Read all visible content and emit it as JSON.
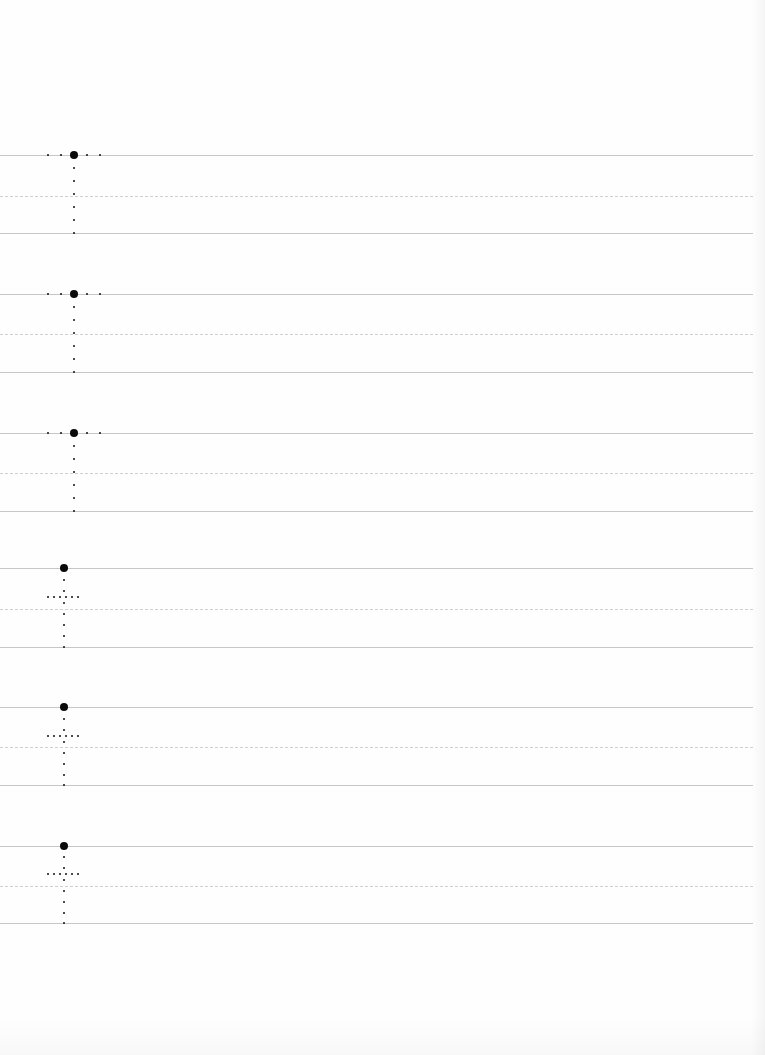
{
  "worksheet": {
    "title": "Handwriting Practice Worksheet",
    "page_width": 765,
    "page_height": 1055,
    "background_color": "#fefefe",
    "header_area_height": 155,
    "line_color": "#c6c6c6",
    "midline_color": "#cfcfd4",
    "dot_color": "#111111",
    "start_dot_color": "#0a0a0a",
    "line_left": 0,
    "line_right": 753,
    "row_pitch": 139
  },
  "rows": [
    {
      "index": 1,
      "label": "practice-row-1",
      "letter": "T",
      "top_y": 155,
      "mid_y": 196,
      "base_y": 233,
      "stem_x": 74,
      "start_dot": {
        "x": 74,
        "y": 155
      },
      "horizontal_dots": [
        {
          "x": 48,
          "y": 155
        },
        {
          "x": 61,
          "y": 155
        },
        {
          "x": 87,
          "y": 155
        },
        {
          "x": 100,
          "y": 155
        }
      ],
      "vertical_dots": [
        {
          "x": 74,
          "y": 168
        },
        {
          "x": 74,
          "y": 181
        },
        {
          "x": 74,
          "y": 194
        },
        {
          "x": 74,
          "y": 207
        },
        {
          "x": 74,
          "y": 220
        },
        {
          "x": 74,
          "y": 233
        }
      ]
    },
    {
      "index": 2,
      "label": "practice-row-2",
      "letter": "T",
      "top_y": 294,
      "mid_y": 334,
      "base_y": 372,
      "stem_x": 74,
      "start_dot": {
        "x": 74,
        "y": 294
      },
      "horizontal_dots": [
        {
          "x": 48,
          "y": 294
        },
        {
          "x": 61,
          "y": 294
        },
        {
          "x": 87,
          "y": 294
        },
        {
          "x": 100,
          "y": 294
        }
      ],
      "vertical_dots": [
        {
          "x": 74,
          "y": 307
        },
        {
          "x": 74,
          "y": 320
        },
        {
          "x": 74,
          "y": 333
        },
        {
          "x": 74,
          "y": 346
        },
        {
          "x": 74,
          "y": 359
        },
        {
          "x": 74,
          "y": 372
        }
      ]
    },
    {
      "index": 3,
      "label": "practice-row-3",
      "letter": "T",
      "top_y": 433,
      "mid_y": 473,
      "base_y": 511,
      "stem_x": 74,
      "start_dot": {
        "x": 74,
        "y": 433
      },
      "horizontal_dots": [
        {
          "x": 48,
          "y": 433
        },
        {
          "x": 61,
          "y": 433
        },
        {
          "x": 87,
          "y": 433
        },
        {
          "x": 100,
          "y": 433
        }
      ],
      "vertical_dots": [
        {
          "x": 74,
          "y": 446
        },
        {
          "x": 74,
          "y": 459
        },
        {
          "x": 74,
          "y": 472
        },
        {
          "x": 74,
          "y": 485
        },
        {
          "x": 74,
          "y": 498
        },
        {
          "x": 74,
          "y": 511
        }
      ]
    },
    {
      "index": 4,
      "label": "practice-row-4",
      "letter": "t",
      "top_y": 568,
      "mid_y": 609,
      "base_y": 647,
      "stem_x": 64,
      "start_dot": {
        "x": 64,
        "y": 568
      },
      "horizontal_dots": [
        {
          "x": 48,
          "y": 597
        },
        {
          "x": 54,
          "y": 597
        },
        {
          "x": 60,
          "y": 597
        },
        {
          "x": 66,
          "y": 597
        },
        {
          "x": 72,
          "y": 597
        },
        {
          "x": 78,
          "y": 597
        }
      ],
      "vertical_dots": [
        {
          "x": 64,
          "y": 580
        },
        {
          "x": 64,
          "y": 591
        },
        {
          "x": 64,
          "y": 603
        },
        {
          "x": 64,
          "y": 614
        },
        {
          "x": 64,
          "y": 625
        },
        {
          "x": 64,
          "y": 636
        },
        {
          "x": 64,
          "y": 647
        }
      ]
    },
    {
      "index": 5,
      "label": "practice-row-5",
      "letter": "t",
      "top_y": 707,
      "mid_y": 747,
      "base_y": 785,
      "stem_x": 64,
      "start_dot": {
        "x": 64,
        "y": 707
      },
      "horizontal_dots": [
        {
          "x": 48,
          "y": 736
        },
        {
          "x": 54,
          "y": 736
        },
        {
          "x": 60,
          "y": 736
        },
        {
          "x": 66,
          "y": 736
        },
        {
          "x": 72,
          "y": 736
        },
        {
          "x": 78,
          "y": 736
        }
      ],
      "vertical_dots": [
        {
          "x": 64,
          "y": 719
        },
        {
          "x": 64,
          "y": 730
        },
        {
          "x": 64,
          "y": 742
        },
        {
          "x": 64,
          "y": 753
        },
        {
          "x": 64,
          "y": 764
        },
        {
          "x": 64,
          "y": 775
        },
        {
          "x": 64,
          "y": 785
        }
      ]
    },
    {
      "index": 6,
      "label": "practice-row-6",
      "letter": "t",
      "top_y": 846,
      "mid_y": 886,
      "base_y": 923,
      "stem_x": 64,
      "start_dot": {
        "x": 64,
        "y": 846
      },
      "horizontal_dots": [
        {
          "x": 48,
          "y": 874
        },
        {
          "x": 54,
          "y": 874
        },
        {
          "x": 60,
          "y": 874
        },
        {
          "x": 66,
          "y": 874
        },
        {
          "x": 72,
          "y": 874
        },
        {
          "x": 78,
          "y": 874
        }
      ],
      "vertical_dots": [
        {
          "x": 64,
          "y": 857
        },
        {
          "x": 64,
          "y": 868
        },
        {
          "x": 64,
          "y": 880
        },
        {
          "x": 64,
          "y": 891
        },
        {
          "x": 64,
          "y": 902
        },
        {
          "x": 64,
          "y": 913
        },
        {
          "x": 64,
          "y": 923
        }
      ]
    }
  ]
}
